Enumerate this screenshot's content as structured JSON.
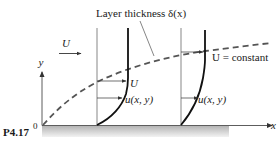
{
  "figure": {
    "problem_label": "P4.17",
    "origin_label": "0",
    "x_axis_label": "x",
    "y_axis_label": "y",
    "freestream_label": "U",
    "layer_label": "Layer thickness δ(x)",
    "constant_label": "U = constant",
    "profile1": {
      "edge_velocity_label": "U",
      "velocity_label": "u(x, y)"
    },
    "profile2": {
      "velocity_label": "u(x, y)"
    }
  },
  "colors": {
    "ink": "#1a1a1a",
    "ground_shade": "#c8c8c8",
    "dashed_curve": "#555555"
  }
}
